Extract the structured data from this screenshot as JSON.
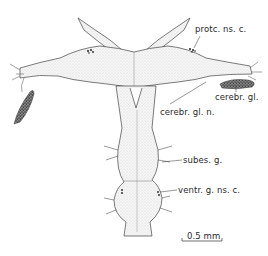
{
  "figure": {
    "labels": [
      {
        "id": "protc-ns-c",
        "text": "protc. ns. c.",
        "x": 197,
        "y": 28
      },
      {
        "id": "cerebr-gl",
        "text": "cerebr. gl.",
        "x": 215,
        "y": 88
      },
      {
        "id": "cerebr-gl-n",
        "text": "cerebr. gl. n.",
        "x": 161,
        "y": 106
      },
      {
        "id": "subes-g",
        "text": "subes. g.",
        "x": 183,
        "y": 156
      },
      {
        "id": "ventr-g-ns-c",
        "text": "ventr. g. ns. c.",
        "x": 178,
        "y": 185
      }
    ],
    "scale_bar": {
      "text": "0.5 mm",
      "x": 185,
      "y": 231
    }
  },
  "colors": {
    "ink": "#2a2a2a",
    "stipple": "#cfcfcf",
    "gland": "#555555",
    "background": "#ffffff"
  }
}
